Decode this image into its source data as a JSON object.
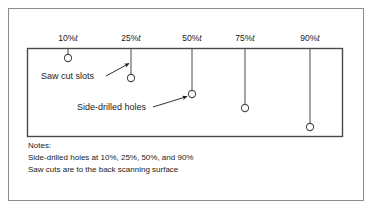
{
  "figure": {
    "outer_frame": {
      "label": "figure-border"
    },
    "specimen_block": {
      "label": "calibration-block"
    },
    "line_color": "#4a4a4a",
    "text_color": "#1a1a1a",
    "background": "#ffffff",
    "depth_markers": [
      {
        "label": "10%",
        "unit": "t",
        "label_x": 68,
        "label_y": 40,
        "line_x": 68,
        "line_top": 48,
        "circle_cx": 68,
        "circle_cy": 58,
        "r": 3.6
      },
      {
        "label": "25%",
        "unit": "t",
        "label_x": 131,
        "label_y": 40,
        "line_x": 131,
        "line_top": 48,
        "circle_cx": 131,
        "circle_cy": 78,
        "r": 3.6
      },
      {
        "label": "50%",
        "unit": "t",
        "label_x": 192,
        "label_y": 40,
        "line_x": 192,
        "line_top": 48,
        "circle_cx": 192,
        "circle_cy": 94,
        "r": 3.6
      },
      {
        "label": "75%",
        "unit": "t",
        "label_x": 245,
        "label_y": 40,
        "line_x": 245,
        "line_top": 48,
        "circle_cx": 245,
        "circle_cy": 108,
        "r": 3.6
      },
      {
        "label": "90%",
        "unit": "t",
        "label_x": 310,
        "label_y": 40,
        "line_x": 310,
        "line_top": 48,
        "circle_cx": 310,
        "circle_cy": 127,
        "r": 3.6
      }
    ],
    "callouts": [
      {
        "name": "saw-cut-slots",
        "text": "Saw cut slots",
        "text_x": 41,
        "text_y": 79,
        "arrow_from_x": 106,
        "arrow_from_y": 76,
        "arrow_to_x": 130,
        "arrow_to_y": 63
      },
      {
        "name": "side-drilled-holes",
        "text": "Side-drilled holes",
        "text_x": 77,
        "text_y": 110,
        "arrow_from_x": 153,
        "arrow_from_y": 107,
        "arrow_to_x": 188,
        "arrow_to_y": 96
      }
    ],
    "notes": {
      "heading": "Notes:",
      "lines": [
        "Side-drilled holes at 10%, 25%, 50%, and 90%",
        "Saw cuts are to the back scanning surface"
      ]
    }
  }
}
